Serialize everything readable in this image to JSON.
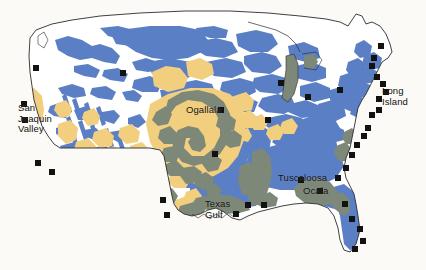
{
  "map": {
    "title": "Principal Aquifers of the Conterminous United States",
    "width": 426,
    "height": 270,
    "background_color": "#fbfaf6",
    "outline_color": "#2b2b2b",
    "colors": {
      "background": "#fbfaf6",
      "land": "#ffffff",
      "aquifer_blue": "#5b7fc4",
      "aquifer_sand": "#f2cf7f",
      "aquifer_gray": "#7e8878",
      "lake_gray": "#7e8878",
      "marker_black": "#121212",
      "label_text": "#10100f"
    },
    "labels": [
      {
        "id": "san-joaquin-valley",
        "text": "San\nJoaquin\nValley"
      },
      {
        "id": "ogallala",
        "text": "Ogallala"
      },
      {
        "id": "texas-gulf",
        "text": "Texas\nGulf"
      },
      {
        "id": "tuscaloosa",
        "text": "Tuscaloosa"
      },
      {
        "id": "ocala",
        "text": "Ocala"
      },
      {
        "id": "long-island",
        "text": "Long\nIsland"
      }
    ],
    "markers": [
      {
        "id": "marker-pacific-nw",
        "x": 36,
        "y": 68
      },
      {
        "id": "marker-san-joaquin-n",
        "x": 24,
        "y": 104
      },
      {
        "id": "marker-san-joaquin-s",
        "x": 25,
        "y": 120
      },
      {
        "id": "marker-california-south",
        "x": 38,
        "y": 163
      },
      {
        "id": "marker-california-coast",
        "x": 52,
        "y": 172
      },
      {
        "id": "marker-arizona",
        "x": 163,
        "y": 200
      },
      {
        "id": "marker-new-mexico",
        "x": 167,
        "y": 215
      },
      {
        "id": "marker-ogallala-e",
        "x": 221,
        "y": 110
      },
      {
        "id": "marker-oklahoma",
        "x": 215,
        "y": 154
      },
      {
        "id": "marker-texas-gulf-a",
        "x": 248,
        "y": 205
      },
      {
        "id": "marker-texas-gulf-b",
        "x": 236,
        "y": 214
      },
      {
        "id": "marker-gulf-coast",
        "x": 264,
        "y": 205
      },
      {
        "id": "marker-tuscaloosa-s",
        "x": 301,
        "y": 180
      },
      {
        "id": "marker-ocala-s",
        "x": 320,
        "y": 191
      },
      {
        "id": "marker-florida-nw",
        "x": 345,
        "y": 204
      },
      {
        "id": "marker-florida-ne",
        "x": 348,
        "y": 206
      },
      {
        "id": "marker-florida-e1",
        "x": 352,
        "y": 219
      },
      {
        "id": "marker-florida-e2",
        "x": 360,
        "y": 229
      },
      {
        "id": "marker-florida-e3",
        "x": 363,
        "y": 241
      },
      {
        "id": "marker-florida-s",
        "x": 355,
        "y": 249
      },
      {
        "id": "marker-carolina-s",
        "x": 338,
        "y": 178
      },
      {
        "id": "marker-carolina-n",
        "x": 346,
        "y": 168
      },
      {
        "id": "marker-virginia",
        "x": 352,
        "y": 155
      },
      {
        "id": "marker-chesapeake",
        "x": 357,
        "y": 145
      },
      {
        "id": "marker-delmarva",
        "x": 364,
        "y": 136
      },
      {
        "id": "marker-newjersey",
        "x": 368,
        "y": 128
      },
      {
        "id": "marker-long-island-w",
        "x": 372,
        "y": 115
      },
      {
        "id": "marker-long-island-e",
        "x": 379,
        "y": 110
      },
      {
        "id": "marker-connecticut",
        "x": 379,
        "y": 99
      },
      {
        "id": "marker-rhode-island",
        "x": 386,
        "y": 92
      },
      {
        "id": "marker-cape-cod",
        "x": 383,
        "y": 84
      },
      {
        "id": "marker-boston",
        "x": 377,
        "y": 77
      },
      {
        "id": "marker-new-hampshire",
        "x": 372,
        "y": 66
      },
      {
        "id": "marker-maine-coast",
        "x": 374,
        "y": 58
      },
      {
        "id": "marker-maine-north",
        "x": 381,
        "y": 46
      },
      {
        "id": "marker-great-lakes",
        "x": 340,
        "y": 90
      },
      {
        "id": "marker-ohio",
        "x": 308,
        "y": 97
      },
      {
        "id": "marker-michigan",
        "x": 281,
        "y": 83
      },
      {
        "id": "marker-minnesota",
        "x": 268,
        "y": 120
      },
      {
        "id": "marker-dakotas",
        "x": 123,
        "y": 73
      },
      {
        "id": "marker-kansas",
        "x": 216,
        "y": 156
      }
    ]
  }
}
